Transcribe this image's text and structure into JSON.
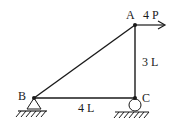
{
  "diagram": {
    "type": "truss",
    "colors": {
      "stroke": "#1a1a1a",
      "background": "#ffffff"
    },
    "nodes": {
      "A": {
        "label": "A"
      },
      "B": {
        "label": "B"
      },
      "C": {
        "label": "C"
      }
    },
    "members": [
      {
        "from": "B",
        "to": "A"
      },
      {
        "from": "A",
        "to": "C"
      },
      {
        "from": "B",
        "to": "C"
      }
    ],
    "dimensions": {
      "AC": "3 L",
      "BC": "4 L"
    },
    "load": {
      "node": "A",
      "label": "4 P",
      "direction": "right"
    },
    "supports": {
      "B": "pin",
      "C": "roller"
    }
  }
}
